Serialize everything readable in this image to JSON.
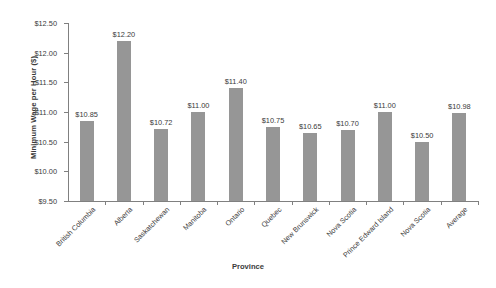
{
  "chart_data": {
    "type": "bar",
    "title": "",
    "xlabel": "Province",
    "ylabel": "Minimum Wage per Hour ($)",
    "ylim": [
      9.5,
      12.5
    ],
    "ytick_labels": [
      "$12.50",
      "$12.00",
      "$11.50",
      "$11.00",
      "$10.50",
      "$10.00",
      "$9.50"
    ],
    "ytick_values": [
      12.5,
      12.0,
      11.5,
      11.0,
      10.5,
      10.0,
      9.5
    ],
    "grid": false,
    "legend": false,
    "bar_color": "#969696",
    "axis_color": "#808080",
    "text_color": "#3b3b3b",
    "categories": [
      "British Columbia",
      "Alberta",
      "Saskatchewan",
      "Manitoba",
      "Ontario",
      "Quebec",
      "New Brunswick",
      "Nova Scotia",
      "Prince Edward Island",
      "Nova Scotia",
      "Average"
    ],
    "values": [
      10.85,
      12.2,
      10.72,
      11.0,
      11.4,
      10.75,
      10.65,
      10.7,
      11.0,
      10.5,
      10.98
    ],
    "data_labels": [
      "$10.85",
      "$12.20",
      "$10.72",
      "$11.00",
      "$11.40",
      "$10.75",
      "$10.65",
      "$10.70",
      "$11.00",
      "$10.50",
      "$10.98"
    ]
  }
}
